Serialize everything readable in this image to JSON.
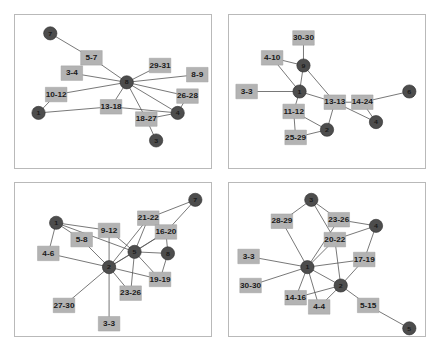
{
  "figure": {
    "title": "",
    "layout": "2x2 grid of network graphs",
    "background_color": "#ffffff",
    "panel_border_color": "#b9b9b9",
    "circle_node_color": "#4d4d4d",
    "square_node_color": "#b3b3b3",
    "edge_color": "#555555"
  },
  "chart_data": {
    "type": "diagram",
    "subtype": "node-link network graph",
    "title": "",
    "xlabel": "",
    "ylabel": "",
    "grid": false,
    "legend": null,
    "panels": [
      {
        "name": "panel-top-left",
        "position": "top-left",
        "circle_nodes": [
          {
            "id": "7",
            "label": "7",
            "x": 18,
            "y": 12
          },
          {
            "id": "8",
            "label": "8",
            "x": 57,
            "y": 44
          },
          {
            "id": "1",
            "label": "1",
            "x": 12,
            "y": 64
          },
          {
            "id": "4",
            "label": "4",
            "x": 83,
            "y": 64
          },
          {
            "id": "3",
            "label": "3",
            "x": 72,
            "y": 82
          }
        ],
        "square_nodes": [
          {
            "label": "5-7",
            "x": 39,
            "y": 28
          },
          {
            "label": "29-31",
            "x": 74,
            "y": 33
          },
          {
            "label": "3-4",
            "x": 29,
            "y": 38
          },
          {
            "label": "8-9",
            "x": 93,
            "y": 39
          },
          {
            "label": "10-12",
            "x": 21,
            "y": 52
          },
          {
            "label": "26-28",
            "x": 88,
            "y": 53
          },
          {
            "label": "13-18",
            "x": 49,
            "y": 60
          },
          {
            "label": "18-27",
            "x": 67,
            "y": 68
          }
        ],
        "edges": [
          [
            "7",
            "5-7"
          ],
          [
            "5-7",
            "8"
          ],
          [
            "8",
            "29-31"
          ],
          [
            "8",
            "8-9"
          ],
          [
            "8",
            "3-4"
          ],
          [
            "8",
            "10-12"
          ],
          [
            "8",
            "26-28"
          ],
          [
            "8",
            "13-18"
          ],
          [
            "8",
            "18-27"
          ],
          [
            "8",
            "4"
          ],
          [
            "10-12",
            "1"
          ],
          [
            "1",
            "13-18"
          ],
          [
            "13-18",
            "4"
          ],
          [
            "26-28",
            "4"
          ],
          [
            "18-27",
            "4"
          ],
          [
            "18-27",
            "3"
          ]
        ]
      },
      {
        "name": "panel-top-right",
        "position": "top-right",
        "circle_nodes": [
          {
            "id": "9",
            "label": "9",
            "x": 38,
            "y": 33
          },
          {
            "id": "1",
            "label": "1",
            "x": 36,
            "y": 50
          },
          {
            "id": "6",
            "label": "6",
            "x": 92,
            "y": 50
          },
          {
            "id": "4",
            "label": "4",
            "x": 75,
            "y": 70
          },
          {
            "id": "2",
            "label": "2",
            "x": 50,
            "y": 75
          }
        ],
        "square_nodes": [
          {
            "label": "30-30",
            "x": 38,
            "y": 15
          },
          {
            "label": "4-10",
            "x": 22,
            "y": 28
          },
          {
            "label": "3-3",
            "x": 9,
            "y": 50
          },
          {
            "label": "13-13",
            "x": 54,
            "y": 57
          },
          {
            "label": "14-24",
            "x": 68,
            "y": 57
          },
          {
            "label": "11-12",
            "x": 33,
            "y": 63
          },
          {
            "label": "25-29",
            "x": 34,
            "y": 80
          }
        ],
        "edges": [
          [
            "30-30",
            "9"
          ],
          [
            "4-10",
            "9"
          ],
          [
            "4-10",
            "1"
          ],
          [
            "9",
            "1"
          ],
          [
            "9",
            "13-13"
          ],
          [
            "3-3",
            "1"
          ],
          [
            "1",
            "13-13"
          ],
          [
            "1",
            "11-12"
          ],
          [
            "13-13",
            "14-24"
          ],
          [
            "13-13",
            "4"
          ],
          [
            "13-13",
            "2"
          ],
          [
            "14-24",
            "6"
          ],
          [
            "14-24",
            "4"
          ],
          [
            "11-12",
            "2"
          ],
          [
            "11-12",
            "25-29"
          ],
          [
            "25-29",
            "2"
          ]
        ]
      },
      {
        "name": "panel-bottom-left",
        "position": "bottom-left",
        "circle_nodes": [
          {
            "id": "7",
            "label": "7",
            "x": 92,
            "y": 11
          },
          {
            "id": "1",
            "label": "1",
            "x": 21,
            "y": 26
          },
          {
            "id": "5",
            "label": "5",
            "x": 61,
            "y": 45
          },
          {
            "id": "8",
            "label": "8",
            "x": 78,
            "y": 46
          },
          {
            "id": "2",
            "label": "2",
            "x": 48,
            "y": 55
          }
        ],
        "square_nodes": [
          {
            "label": "21-22",
            "x": 68,
            "y": 23
          },
          {
            "label": "9-12",
            "x": 48,
            "y": 31
          },
          {
            "label": "16-20",
            "x": 77,
            "y": 32
          },
          {
            "label": "5-8",
            "x": 34,
            "y": 37
          },
          {
            "label": "4-6",
            "x": 17,
            "y": 46
          },
          {
            "label": "19-19",
            "x": 74,
            "y": 63
          },
          {
            "label": "23-26",
            "x": 59,
            "y": 72
          },
          {
            "label": "27-30",
            "x": 25,
            "y": 80
          },
          {
            "label": "3-3",
            "x": 48,
            "y": 92
          }
        ],
        "edges": [
          [
            "1",
            "5-8"
          ],
          [
            "1",
            "4-6"
          ],
          [
            "1",
            "9-12"
          ],
          [
            "1",
            "5"
          ],
          [
            "5-8",
            "2"
          ],
          [
            "4-6",
            "2"
          ],
          [
            "9-12",
            "2"
          ],
          [
            "9-12",
            "5"
          ],
          [
            "21-22",
            "7"
          ],
          [
            "21-22",
            "2"
          ],
          [
            "21-22",
            "5"
          ],
          [
            "16-20",
            "7"
          ],
          [
            "16-20",
            "5"
          ],
          [
            "16-20",
            "8"
          ],
          [
            "5",
            "8"
          ],
          [
            "5",
            "19-19"
          ],
          [
            "5",
            "23-26"
          ],
          [
            "5",
            "2"
          ],
          [
            "19-19",
            "2"
          ],
          [
            "19-19",
            "8"
          ],
          [
            "23-26",
            "2"
          ],
          [
            "2",
            "27-30"
          ],
          [
            "2",
            "3-3"
          ],
          [
            "2",
            "16-20"
          ]
        ]
      },
      {
        "name": "panel-bottom-right",
        "position": "bottom-right",
        "circle_nodes": [
          {
            "id": "3",
            "label": "3",
            "x": 42,
            "y": 11
          },
          {
            "id": "4",
            "label": "4",
            "x": 75,
            "y": 28
          },
          {
            "id": "1",
            "label": "1",
            "x": 40,
            "y": 55
          },
          {
            "id": "2",
            "label": "2",
            "x": 57,
            "y": 67
          },
          {
            "id": "5",
            "label": "5",
            "x": 92,
            "y": 95
          }
        ],
        "square_nodes": [
          {
            "label": "28-29",
            "x": 27,
            "y": 25
          },
          {
            "label": "23-26",
            "x": 56,
            "y": 24
          },
          {
            "label": "20-22",
            "x": 54,
            "y": 37
          },
          {
            "label": "17-19",
            "x": 69,
            "y": 50
          },
          {
            "label": "3-3",
            "x": 10,
            "y": 48
          },
          {
            "label": "30-30",
            "x": 11,
            "y": 67
          },
          {
            "label": "14-16",
            "x": 34,
            "y": 75
          },
          {
            "label": "4-4",
            "x": 46,
            "y": 81
          },
          {
            "label": "5-15",
            "x": 71,
            "y": 80
          }
        ],
        "edges": [
          [
            "3",
            "28-29"
          ],
          [
            "3",
            "23-26"
          ],
          [
            "3",
            "20-22"
          ],
          [
            "28-29",
            "1"
          ],
          [
            "23-26",
            "4"
          ],
          [
            "23-26",
            "1"
          ],
          [
            "20-22",
            "1"
          ],
          [
            "20-22",
            "2"
          ],
          [
            "20-22",
            "4"
          ],
          [
            "4",
            "17-19"
          ],
          [
            "17-19",
            "1"
          ],
          [
            "17-19",
            "2"
          ],
          [
            "3-3",
            "1"
          ],
          [
            "30-30",
            "1"
          ],
          [
            "1",
            "14-16"
          ],
          [
            "1",
            "4-4"
          ],
          [
            "1",
            "2"
          ],
          [
            "14-16",
            "2"
          ],
          [
            "4-4",
            "2"
          ],
          [
            "2",
            "5-15"
          ],
          [
            "5-15",
            "5"
          ]
        ]
      }
    ]
  }
}
